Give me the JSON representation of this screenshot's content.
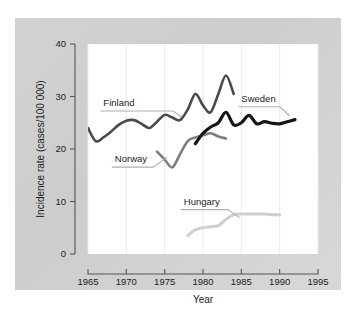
{
  "chart_data": {
    "type": "line",
    "title": "",
    "xlabel": "Year",
    "ylabel": "Incidence rate (cases/100 000)",
    "xlim": [
      1965,
      1995
    ],
    "ylim": [
      0,
      40
    ],
    "xticks": [
      1965,
      1970,
      1975,
      1980,
      1985,
      1990,
      1995
    ],
    "yticks": [
      0,
      10,
      20,
      30,
      40
    ],
    "xtick_labels": [
      "1965",
      "1970",
      "1975",
      "1980",
      "1985",
      "1990",
      "1995"
    ],
    "ytick_labels": [
      "0",
      "10",
      "20",
      "30",
      "40"
    ],
    "grid": "vertical-faint",
    "legend": "inline-labels-with-leader-lines",
    "series": [
      {
        "name": "Finland",
        "color": "#4a4a4a",
        "label_x": 1967.0,
        "label_y": 28.2,
        "x": [
          1965,
          1966,
          1967,
          1968,
          1969,
          1970,
          1971,
          1972,
          1973,
          1974,
          1975,
          1976,
          1977,
          1978,
          1979,
          1980,
          1981,
          1982,
          1983,
          1984
        ],
        "y": [
          24.0,
          21.5,
          22.2,
          23.3,
          24.6,
          25.4,
          25.5,
          24.8,
          24.0,
          25.2,
          26.5,
          26.0,
          25.5,
          27.5,
          30.5,
          28.3,
          27.0,
          30.5,
          34.0,
          30.5
        ]
      },
      {
        "name": "Norway",
        "color": "#7d7d7d",
        "label_x": 1968.5,
        "label_y": 17.5,
        "x": [
          1974,
          1975,
          1976,
          1977,
          1978,
          1979,
          1980,
          1981,
          1982,
          1983
        ],
        "y": [
          19.5,
          18.0,
          16.5,
          19.0,
          21.5,
          22.2,
          22.6,
          23.0,
          22.4,
          22.0
        ]
      },
      {
        "name": "Sweden",
        "color": "#141414",
        "label_x": 1985.0,
        "label_y": 29.0,
        "x": [
          1979,
          1980,
          1981,
          1982,
          1983,
          1984,
          1985,
          1986,
          1987,
          1988,
          1989,
          1990,
          1991,
          1992
        ],
        "y": [
          21.0,
          23.0,
          24.2,
          25.0,
          27.0,
          24.6,
          25.0,
          26.4,
          24.8,
          25.2,
          24.9,
          24.8,
          25.2,
          25.6
        ]
      },
      {
        "name": "Hungary",
        "color": "#cfcfcf",
        "label_x": 1977.5,
        "label_y": 9.4,
        "x": [
          1978,
          1979,
          1980,
          1981,
          1982,
          1983,
          1984,
          1985,
          1986,
          1987,
          1988,
          1989,
          1990
        ],
        "y": [
          3.5,
          4.6,
          5.0,
          5.2,
          5.4,
          6.6,
          7.5,
          7.6,
          7.6,
          7.6,
          7.6,
          7.5,
          7.5
        ]
      }
    ]
  }
}
